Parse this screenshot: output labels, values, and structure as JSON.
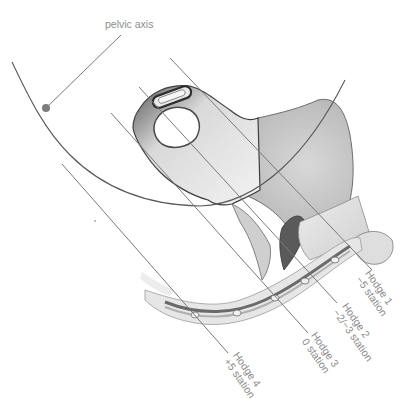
{
  "title_label": "pelvic axis",
  "colors": {
    "line": "#7a7a7a",
    "axis_dot": "#7d7d7d",
    "label_text": "#8a8a8a",
    "bone_dark": "#3a3a3a",
    "bone_mid": "#9a9a9a",
    "bone_light": "#e4e4e4"
  },
  "planes": [
    {
      "name": "Hodge 1",
      "station": "−5 station"
    },
    {
      "name": "Hodge 2",
      "station": "−2/−3 station"
    },
    {
      "name": "Hodge 3",
      "station": "0 station"
    },
    {
      "name": "Hodge 4",
      "station": "+5 station"
    }
  ]
}
